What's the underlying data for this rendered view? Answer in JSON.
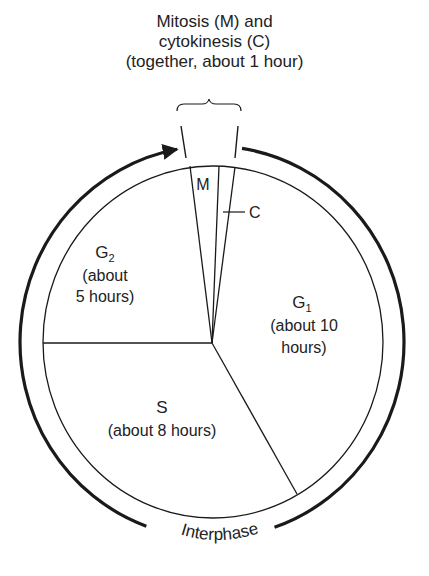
{
  "diagram": {
    "title_lines": [
      "Mitosis (M) and",
      "cytokinesis (C)",
      "(together, about 1 hour)"
    ],
    "phases": [
      {
        "id": "M",
        "label": "M",
        "hours_note": null
      },
      {
        "id": "C",
        "label": "C",
        "hours_note": null
      },
      {
        "id": "G1",
        "label": "G",
        "subscript": "1",
        "lines": [
          "(about 10",
          "hours)"
        ]
      },
      {
        "id": "S",
        "label": "S",
        "subscript": "",
        "lines": [
          "(about 8 hours)"
        ]
      },
      {
        "id": "G2",
        "label": "G",
        "subscript": "2",
        "lines": [
          "(about",
          "5 hours)"
        ]
      }
    ],
    "outer_ring_label": "Interphase",
    "colors": {
      "ink": "#1a1a1a",
      "background": "#ffffff"
    }
  }
}
